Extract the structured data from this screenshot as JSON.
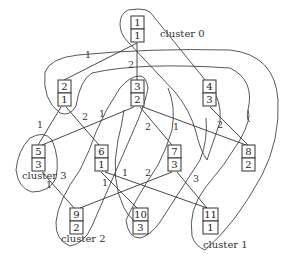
{
  "diagram": {
    "type": "clustered-graph",
    "nodes": [
      {
        "id": "1",
        "top": "1",
        "bottom": "1",
        "x": 131,
        "y": 16
      },
      {
        "id": "2",
        "top": "2",
        "bottom": "1",
        "x": 58,
        "y": 80
      },
      {
        "id": "3",
        "top": "3",
        "bottom": "2",
        "x": 131,
        "y": 80
      },
      {
        "id": "4",
        "top": "4",
        "bottom": "3",
        "x": 203,
        "y": 80
      },
      {
        "id": "5",
        "top": "5",
        "bottom": "3",
        "x": 32,
        "y": 145
      },
      {
        "id": "6",
        "top": "6",
        "bottom": "1",
        "x": 95,
        "y": 145
      },
      {
        "id": "7",
        "top": "7",
        "bottom": "3",
        "x": 168,
        "y": 145
      },
      {
        "id": "8",
        "top": "8",
        "bottom": "2",
        "x": 242,
        "y": 145
      },
      {
        "id": "9",
        "top": "9",
        "bottom": "2",
        "x": 70,
        "y": 208
      },
      {
        "id": "10",
        "top": "10",
        "bottom": "3",
        "x": 133,
        "y": 208
      },
      {
        "id": "11",
        "top": "11",
        "bottom": "1",
        "x": 203,
        "y": 208
      }
    ],
    "edges": [
      {
        "from": "1",
        "to": "2"
      },
      {
        "from": "1",
        "to": "3"
      },
      {
        "from": "2",
        "to": "5"
      },
      {
        "from": "2",
        "to": "6"
      },
      {
        "from": "3",
        "to": "5"
      },
      {
        "from": "3",
        "to": "7"
      },
      {
        "from": "3",
        "to": "8"
      },
      {
        "from": "4",
        "to": "8"
      },
      {
        "from": "5",
        "to": "9"
      },
      {
        "from": "6",
        "to": "10"
      },
      {
        "from": "6",
        "to": "11"
      },
      {
        "from": "7",
        "to": "9"
      },
      {
        "from": "7",
        "to": "11"
      }
    ],
    "edge_labels": [
      {
        "text": "1",
        "x": 85,
        "y": 58
      },
      {
        "text": "2",
        "x": 128,
        "y": 68
      },
      {
        "text": "1",
        "x": 37,
        "y": 128
      },
      {
        "text": "2",
        "x": 82,
        "y": 120
      },
      {
        "text": "1",
        "x": 99,
        "y": 117
      },
      {
        "text": "2",
        "x": 145,
        "y": 130
      },
      {
        "text": "1",
        "x": 173,
        "y": 130
      },
      {
        "text": "2",
        "x": 217,
        "y": 128
      },
      {
        "text": "1",
        "x": 122,
        "y": 176
      },
      {
        "text": "2",
        "x": 145,
        "y": 176
      },
      {
        "text": "1",
        "x": 102,
        "y": 186
      },
      {
        "text": "3",
        "x": 193,
        "y": 182
      },
      {
        "text": "1",
        "x": 46,
        "y": 188
      }
    ],
    "clusters": [
      {
        "label": "cluster 0",
        "label_x": 160,
        "label_y": 37
      },
      {
        "label": "cluster 1",
        "label_x": 203,
        "label_y": 248
      },
      {
        "label": "cluster 2",
        "label_x": 61,
        "label_y": 242
      },
      {
        "label": "cluster 3",
        "label_x": 22,
        "label_y": 179
      }
    ]
  }
}
